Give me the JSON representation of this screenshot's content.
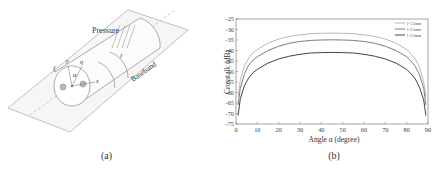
{
  "figure": {
    "panel_a": {
      "caption": "(a)",
      "labels": {
        "pressure": "Pressure",
        "baseband": "Baseband",
        "length": "l",
        "alpha": "α",
        "eta": "η",
        "xi": "ξ",
        "y": "y",
        "x": "x"
      }
    },
    "panel_b": {
      "caption": "(b)"
    }
  },
  "chart_data": {
    "type": "line",
    "title": "",
    "xlabel": "Angle α (degree)",
    "ylabel": "Crosstalk (dB)",
    "xlim": [
      0,
      90
    ],
    "ylim": [
      -75,
      -25
    ],
    "xticks": [
      0,
      10,
      20,
      30,
      40,
      50,
      60,
      70,
      80,
      90
    ],
    "yticks": [
      -25,
      -30,
      -35,
      -40,
      -45,
      -50,
      -55,
      -60,
      -65,
      -70,
      -75
    ],
    "grid": false,
    "legend_position": "upper right",
    "x": [
      1,
      2,
      4,
      6,
      8,
      10,
      15,
      20,
      25,
      30,
      35,
      40,
      45,
      50,
      55,
      60,
      65,
      70,
      75,
      80,
      82,
      84,
      86,
      88,
      89
    ],
    "series": [
      {
        "name": "l=1.5mm",
        "color": "#b0b0b0",
        "values": [
          -62,
          -54,
          -47,
          -43.5,
          -41,
          -39.5,
          -36.5,
          -34.5,
          -33.3,
          -32.5,
          -32,
          -31.8,
          -31.7,
          -31.8,
          -32,
          -32.5,
          -33.3,
          -34.5,
          -36.5,
          -39.5,
          -41.5,
          -44,
          -48,
          -55,
          -62
        ]
      },
      {
        "name": "l=2.5mm",
        "color": "#707070",
        "values": [
          -66,
          -58,
          -51,
          -47,
          -44.5,
          -43,
          -40,
          -38,
          -36.5,
          -35.7,
          -35.2,
          -35,
          -34.9,
          -35,
          -35.2,
          -35.7,
          -36.5,
          -38,
          -40,
          -43,
          -45,
          -47.5,
          -51.5,
          -58,
          -66
        ]
      },
      {
        "name": "l=3.5mm",
        "color": "#303030",
        "values": [
          -71,
          -63,
          -56.5,
          -53,
          -50.5,
          -49,
          -46,
          -44,
          -42.7,
          -41.8,
          -41.2,
          -41,
          -40.9,
          -41,
          -41.2,
          -41.8,
          -42.7,
          -44,
          -46,
          -49,
          -51,
          -53.5,
          -57.5,
          -63.5,
          -71
        ]
      }
    ]
  }
}
